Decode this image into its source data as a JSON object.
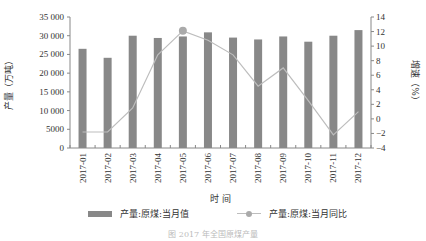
{
  "chart_data": {
    "type": "bar+line",
    "title": "",
    "xlabel": "时 间",
    "ylabel_left": "产量（万吨）",
    "ylabel_right": "增速（%）",
    "categories": [
      "2017-01",
      "2017-02",
      "2017-03",
      "2017-04",
      "2017-05",
      "2017-06",
      "2017-07",
      "2017-08",
      "2017-09",
      "2017-10",
      "2017-11",
      "2017-12"
    ],
    "series": [
      {
        "name": "产量:原煤:当月值",
        "type": "bar",
        "axis": "left",
        "color": "#888888",
        "values": [
          26500,
          24100,
          30000,
          29400,
          29800,
          30900,
          29500,
          29000,
          29800,
          28400,
          30000,
          31500
        ]
      },
      {
        "name": "产量:原煤:当月同比",
        "type": "line",
        "axis": "right",
        "color": "#bdbdbd",
        "marker_index": 4,
        "values": [
          -1.8,
          -1.8,
          1.5,
          8.8,
          12.1,
          10.8,
          8.8,
          4.5,
          7.0,
          2.5,
          -2.2,
          1.0
        ]
      }
    ],
    "ylim_left": [
      0,
      35000
    ],
    "yticks_left": [
      "0",
      "5000",
      "10 000",
      "15 000",
      "20 000",
      "25 000",
      "30 000",
      "35 000"
    ],
    "ylim_right": [
      -4,
      14
    ],
    "yticks_right": [
      "−4",
      "−2",
      "0",
      "2",
      "4",
      "6",
      "8",
      "10",
      "12",
      "14"
    ],
    "grid": false,
    "legend_position": "bottom"
  },
  "legend": {
    "bar_label": "产量:原煤:当月值",
    "line_label": "产量:原煤:当月同比"
  },
  "caption": "图 2017 年全国原煤产量"
}
